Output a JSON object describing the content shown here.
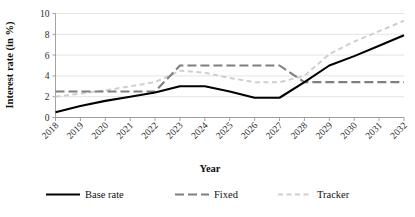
{
  "chart_data": {
    "type": "line",
    "title": "",
    "xlabel": "Year",
    "ylabel": "Interest rate (in %)",
    "categories": [
      "2018",
      "2019",
      "2020",
      "2021",
      "2022",
      "2023",
      "2024",
      "2025",
      "2026",
      "2027",
      "2028",
      "2029",
      "2030",
      "2031",
      "2032"
    ],
    "x": [
      2018,
      2019,
      2020,
      2021,
      2022,
      2023,
      2024,
      2025,
      2026,
      2027,
      2028,
      2029,
      2030,
      2031,
      2032
    ],
    "ylim": [
      0,
      10
    ],
    "yticks": [
      0,
      2,
      4,
      6,
      8,
      10
    ],
    "ytick_labels": [
      "0",
      "2",
      "4",
      "6",
      "8",
      "10"
    ],
    "xlim": [
      2018,
      2032
    ],
    "grid": "horizontal",
    "legend_position": "bottom",
    "series": [
      {
        "name": "Base rate",
        "color": "#000000",
        "style": "solid",
        "values": [
          0.5,
          1.1,
          1.6,
          2.0,
          2.4,
          3.0,
          3.0,
          2.5,
          1.9,
          1.9,
          3.4,
          5.0,
          5.9,
          6.9,
          7.9
        ]
      },
      {
        "name": "Fixed",
        "color": "#7f7f7f",
        "style": "long-dash",
        "values": [
          2.5,
          2.5,
          2.5,
          2.5,
          2.5,
          5.0,
          5.0,
          5.0,
          5.0,
          5.0,
          3.4,
          3.4,
          3.4,
          3.4,
          3.4
        ]
      },
      {
        "name": "Tracker",
        "color": "#cfcfcf",
        "style": "dashed",
        "values": [
          2.0,
          2.3,
          2.6,
          3.0,
          3.4,
          4.5,
          4.3,
          3.8,
          3.4,
          3.4,
          4.0,
          6.1,
          7.3,
          8.3,
          9.3
        ]
      }
    ]
  },
  "legend": {
    "items": [
      {
        "label": "Base rate",
        "swatch": "solid-black-line"
      },
      {
        "label": "Fixed",
        "swatch": "gray-dashed-line"
      },
      {
        "label": "Tracker",
        "swatch": "light-gray-dashed-line"
      }
    ]
  }
}
